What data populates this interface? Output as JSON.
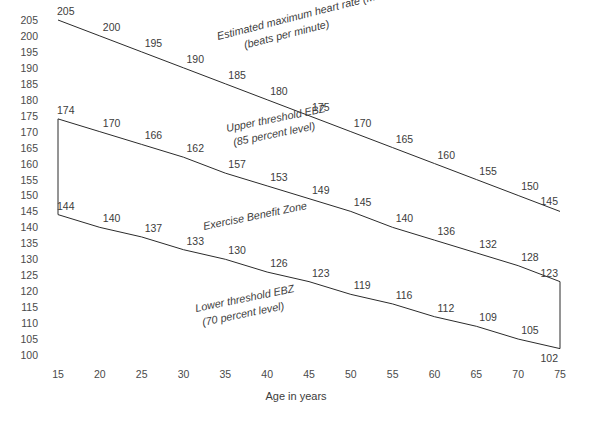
{
  "chart_data": {
    "type": "line",
    "title": "",
    "xlabel": "Age in years",
    "ylabel": "",
    "xlim": [
      15,
      75
    ],
    "ylim": [
      100,
      205
    ],
    "grid": false,
    "legend_position": "inline-annotations",
    "x": [
      15,
      20,
      25,
      30,
      35,
      40,
      45,
      50,
      55,
      60,
      65,
      70,
      75
    ],
    "xticks": [
      "15",
      "20",
      "25",
      "30",
      "35",
      "40",
      "45",
      "50",
      "55",
      "60",
      "65",
      "70",
      "75"
    ],
    "yticks": [
      "205",
      "200",
      "195",
      "190",
      "185",
      "180",
      "175",
      "170",
      "165",
      "160",
      "155",
      "150",
      "145",
      "140",
      "135",
      "130",
      "125",
      "120",
      "115",
      "110",
      "105",
      "100"
    ],
    "series": [
      {
        "name": "Estimated maximum heart rate (MHR)",
        "values": [
          205,
          200,
          195,
          190,
          185,
          180,
          175,
          170,
          165,
          160,
          155,
          150,
          145
        ],
        "labels": [
          "205",
          "200",
          "195",
          "190",
          "185",
          "180",
          "175",
          "170",
          "165",
          "160",
          "155",
          "150",
          "145"
        ]
      },
      {
        "name": "Upper threshold EBZ (85 percent level)",
        "values": [
          174,
          170,
          166,
          162,
          157,
          153,
          149,
          145,
          140,
          136,
          132,
          128,
          123
        ],
        "labels": [
          "174",
          "170",
          "166",
          "162",
          "157",
          "153",
          "149",
          "145",
          "140",
          "136",
          "132",
          "128",
          "123"
        ]
      },
      {
        "name": "Lower threshold EBZ (70 percent level)",
        "values": [
          144,
          140,
          137,
          133,
          130,
          126,
          123,
          119,
          116,
          112,
          109,
          105,
          102
        ],
        "labels": [
          "144",
          "140",
          "137",
          "133",
          "130",
          "126",
          "123",
          "119",
          "116",
          "112",
          "109",
          "105",
          "102"
        ]
      }
    ],
    "annotations": [
      {
        "id": "mhr",
        "lines": [
          "Estimated maximum heart rate (MHR)",
          "(beats per minute)"
        ]
      },
      {
        "id": "upper-threshold",
        "lines": [
          "Upper threshold EBZ",
          "(85 percent level)"
        ]
      },
      {
        "id": "zone",
        "lines": [
          "Exercise Benefit Zone"
        ]
      },
      {
        "id": "lower-threshold",
        "lines": [
          "Lower threshold EBZ",
          "(70 percent level)"
        ]
      }
    ],
    "colors": {
      "line": "#2b2b2b",
      "text": "#3c3c3c",
      "tick_text": "#4a4a4a",
      "background": "#ffffff"
    }
  },
  "axis": {
    "x_title": "Age in years"
  },
  "annotations": {
    "mhr_line1": "Estimated maximum heart rate (MHR)",
    "mhr_line2": "(beats per minute)",
    "upper_line1": "Upper threshold EBZ",
    "upper_line2": "(85 percent level)",
    "zone_line1": "Exercise Benefit Zone",
    "lower_line1": "Lower threshold EBZ",
    "lower_line2": "(70 percent level)"
  }
}
